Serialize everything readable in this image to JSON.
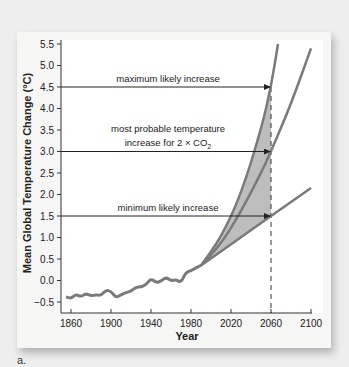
{
  "figure_label": "a.",
  "chart_data": {
    "type": "line",
    "title": "",
    "xlabel": "Year",
    "ylabel": "Mean Global Temperature Change (°C)",
    "xlim": [
      1850,
      2100
    ],
    "ylim": [
      -0.5,
      5.5
    ],
    "x_ticks": [
      "1860",
      "1900",
      "1940",
      "1980",
      "2020",
      "2060",
      "2100"
    ],
    "y_ticks": [
      "5.5",
      "5.0",
      "4.5",
      "4.0",
      "3.5",
      "3.0",
      "2.5",
      "2.0",
      "1.5",
      "1.0",
      "0.5",
      "0.0",
      "-0.5"
    ],
    "grid": false,
    "series": [
      {
        "name": "observed",
        "x": [
          1855,
          1860,
          1865,
          1870,
          1875,
          1880,
          1885,
          1890,
          1895,
          1900,
          1905,
          1910,
          1915,
          1920,
          1925,
          1930,
          1935,
          1940,
          1945,
          1950,
          1955,
          1960,
          1965,
          1970,
          1975,
          1980,
          1985,
          1990
        ],
        "values": [
          -0.38,
          -0.42,
          -0.32,
          -0.38,
          -0.3,
          -0.36,
          -0.33,
          -0.35,
          -0.22,
          -0.25,
          -0.4,
          -0.33,
          -0.28,
          -0.25,
          -0.15,
          -0.15,
          -0.1,
          0.05,
          -0.05,
          -0.02,
          0.08,
          -0.01,
          0.02,
          -0.05,
          0.2,
          0.22,
          0.3,
          0.35
        ]
      },
      {
        "name": "maximum likely increase",
        "x": [
          1990,
          2010,
          2030,
          2050,
          2060,
          2067
        ],
        "values": [
          0.35,
          1.0,
          2.0,
          3.5,
          4.5,
          5.5
        ]
      },
      {
        "name": "most probable increase for 2×CO2",
        "x": [
          1990,
          2010,
          2030,
          2050,
          2060,
          2080,
          2100
        ],
        "values": [
          0.35,
          0.85,
          1.6,
          2.5,
          3.0,
          4.1,
          5.4
        ]
      },
      {
        "name": "minimum likely increase",
        "x": [
          1990,
          2060,
          2100
        ],
        "values": [
          0.35,
          1.5,
          2.15
        ]
      }
    ],
    "shaded_region": {
      "between": [
        "maximum likely increase",
        "minimum likely increase"
      ],
      "x_range": [
        1990,
        2060
      ],
      "color": "#bdbdbd"
    },
    "annotations": [
      {
        "text": "maximum likely increase",
        "y": 4.5,
        "arrow_to_x": 2060
      },
      {
        "text": "most probable temperature",
        "text2": "increase for 2 × CO",
        "subscript": "2",
        "y": 3.0,
        "arrow_to_x": 2060
      },
      {
        "text": "minimum likely increase",
        "y": 1.5,
        "arrow_to_x": 2060
      }
    ],
    "reference_line": {
      "type": "vertical-dashed",
      "x": 2060
    }
  },
  "colors": {
    "curve": "#7a7a7a",
    "shade": "#bdbdbd",
    "axis": "#333333"
  }
}
